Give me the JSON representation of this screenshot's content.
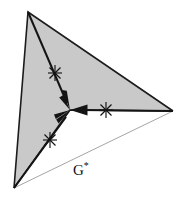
{
  "figure": {
    "type": "geometric-diagram",
    "background_color": "#ffffff",
    "region": {
      "name": "shaded-region",
      "fill_color": "#c9c9c9",
      "outline_color": "#1c1c1c",
      "vertices": [
        {
          "name": "top-vertex",
          "x": 28,
          "y": 12
        },
        {
          "name": "right-vertex",
          "x": 173,
          "y": 111
        },
        {
          "name": "center-junction",
          "x": 70,
          "y": 110
        },
        {
          "name": "bottom-vertex",
          "x": 14,
          "y": 188
        }
      ]
    },
    "boundary_line": {
      "name": "g-star-boundary",
      "color": "#9a9a9a",
      "from": {
        "x": 14,
        "y": 188
      },
      "to": {
        "x": 173,
        "y": 111
      }
    },
    "junction": {
      "x": 70,
      "y": 110
    },
    "arrows": [
      {
        "name": "arrow-from-top",
        "from": {
          "x": 28,
          "y": 12
        },
        "to": {
          "x": 70,
          "y": 110
        },
        "color": "#141414"
      },
      {
        "name": "arrow-from-bottom",
        "from": {
          "x": 14,
          "y": 188
        },
        "to": {
          "x": 70,
          "y": 110
        },
        "color": "#141414"
      },
      {
        "name": "arrow-from-right",
        "from": {
          "x": 173,
          "y": 111
        },
        "to": {
          "x": 70,
          "y": 110
        },
        "color": "#141414"
      }
    ],
    "markers": [
      {
        "name": "star-marker-upper",
        "x": 55,
        "y": 73,
        "glyph": "asterisk-star"
      },
      {
        "name": "star-marker-lower",
        "x": 50,
        "y": 140,
        "glyph": "asterisk-star"
      },
      {
        "name": "star-marker-right",
        "x": 106,
        "y": 110,
        "glyph": "asterisk-star"
      }
    ],
    "labels": [
      {
        "name": "g-star-label",
        "base": "G",
        "superscript": "*",
        "x": 75,
        "y": 162
      }
    ]
  }
}
